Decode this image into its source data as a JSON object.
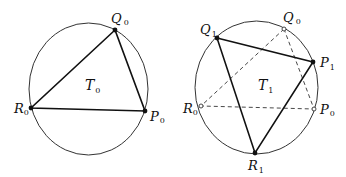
{
  "figure": {
    "left": {
      "triangle_label": "T",
      "triangle_sub": "0",
      "circle": {
        "cx": 88.5,
        "cy": 89,
        "rx": 59.5,
        "ry": 66
      },
      "points": [
        {
          "name": "Q",
          "sub": "0",
          "x": 115,
          "y": 30,
          "style": "filled"
        },
        {
          "name": "R",
          "sub": "0",
          "x": 31,
          "y": 108,
          "style": "filled"
        },
        {
          "name": "P",
          "sub": "0",
          "x": 145,
          "y": 111,
          "style": "filled"
        }
      ]
    },
    "right": {
      "triangle_label": "T",
      "triangle_sub": "1",
      "circle": {
        "cx": 256.5,
        "cy": 87.5,
        "rx": 61.5,
        "ry": 66.5
      },
      "points": [
        {
          "name": "Q",
          "sub": "1",
          "x": 217,
          "y": 38,
          "style": "filled"
        },
        {
          "name": "P",
          "sub": "1",
          "x": 313,
          "y": 62,
          "style": "filled"
        },
        {
          "name": "R",
          "sub": "1",
          "x": 255,
          "y": 153,
          "style": "filled"
        },
        {
          "name": "Q",
          "sub": "0",
          "x": 284,
          "y": 29,
          "style": "open"
        },
        {
          "name": "R",
          "sub": "0",
          "x": 201,
          "y": 106,
          "style": "open"
        },
        {
          "name": "P",
          "sub": "0",
          "x": 314,
          "y": 109,
          "style": "open"
        }
      ]
    }
  }
}
